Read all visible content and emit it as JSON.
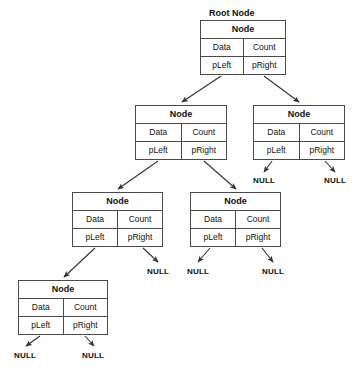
{
  "diagram": {
    "title_caption": "Root Node",
    "labels": {
      "header": "Node",
      "data": "Data",
      "count": "Count",
      "pleft": "pLeft",
      "pright": "pRight",
      "null": "NULL"
    },
    "colors": {
      "background": "#fefefe",
      "box_fill": "#ffffff",
      "border": "#4a4a4a",
      "text": "#111111",
      "connector": "#333333"
    },
    "nodes": [
      {
        "id": "root",
        "caption": "Root Node",
        "header": "Node",
        "data": "Data",
        "count": "Count",
        "pleft": "pLeft",
        "pright": "pRight",
        "x": 200,
        "y": 20,
        "w": 86,
        "h": 55
      },
      {
        "id": "n-l1-left",
        "caption": "",
        "header": "Node",
        "data": "Data",
        "count": "Count",
        "pleft": "pLeft",
        "pright": "pRight",
        "x": 135,
        "y": 105,
        "w": 92,
        "h": 55
      },
      {
        "id": "n-l1-right",
        "caption": "",
        "header": "Node",
        "data": "Data",
        "count": "Count",
        "pleft": "pLeft",
        "pright": "pRight",
        "x": 253,
        "y": 105,
        "w": 92,
        "h": 55
      },
      {
        "id": "n-l2-left",
        "caption": "",
        "header": "Node",
        "data": "Data",
        "count": "Count",
        "pleft": "pLeft",
        "pright": "pRight",
        "x": 72,
        "y": 192,
        "w": 91,
        "h": 55
      },
      {
        "id": "n-l2-right",
        "caption": "",
        "header": "Node",
        "data": "Data",
        "count": "Count",
        "pleft": "pLeft",
        "pright": "pRight",
        "x": 190,
        "y": 192,
        "w": 91,
        "h": 55
      },
      {
        "id": "n-l3-left",
        "caption": "",
        "header": "Node",
        "data": "Data",
        "count": "Count",
        "pleft": "pLeft",
        "pright": "pRight",
        "x": 18,
        "y": 280,
        "w": 90,
        "h": 55
      }
    ],
    "null_terminators": [
      {
        "id": "null-l1-right-left",
        "text": "NULL",
        "x": 253,
        "y": 176
      },
      {
        "id": "null-l1-right-right",
        "text": "NULL",
        "x": 324,
        "y": 176
      },
      {
        "id": "null-l2-left-right",
        "text": "NULL",
        "x": 147,
        "y": 267
      },
      {
        "id": "null-l2-right-left",
        "text": "NULL",
        "x": 187,
        "y": 267
      },
      {
        "id": "null-l2-right-right",
        "text": "NULL",
        "x": 262,
        "y": 267
      },
      {
        "id": "null-l3-left-left",
        "text": "NULL",
        "x": 14,
        "y": 351
      },
      {
        "id": "null-l3-left-right",
        "text": "NULL",
        "x": 82,
        "y": 351
      }
    ]
  }
}
